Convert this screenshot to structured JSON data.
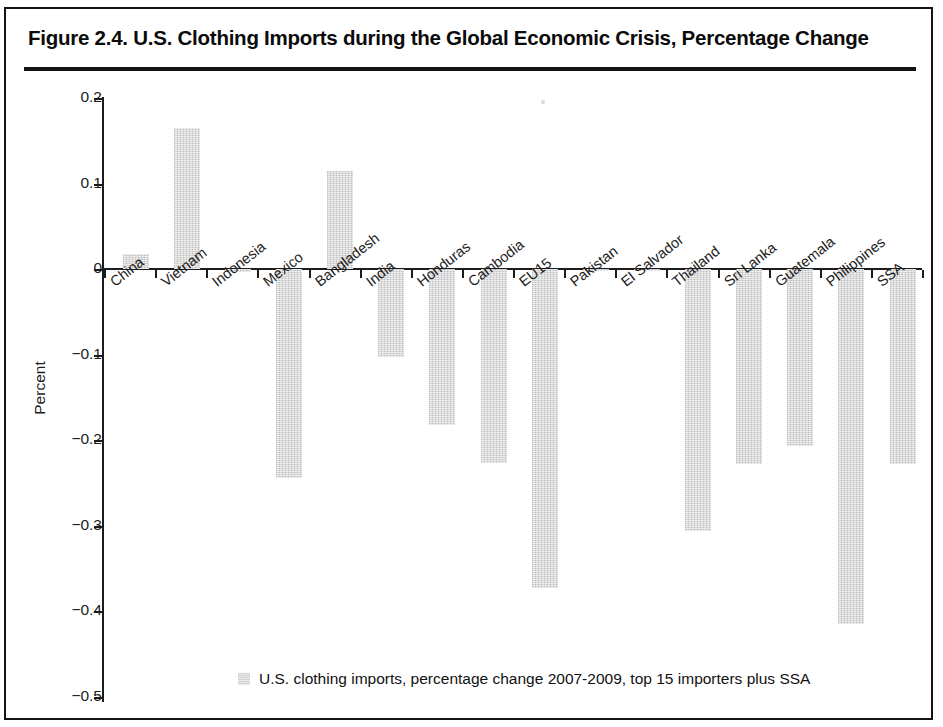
{
  "figure": {
    "title": "Figure 2.4. U.S. Clothing Imports during the Global Economic Crisis, Percentage Change"
  },
  "legend": {
    "label": "U.S. clothing imports, percentage change 2007-2009, top 15 importers plus SSA",
    "swatch_color": "#d3d3d3",
    "position": "bottom-center"
  },
  "axis": {
    "y_title": "Percent",
    "y_ticks": [
      "0.2",
      "0.1",
      "0",
      "−0.1",
      "−0.2",
      "−0.3",
      "−0.4",
      "−0.5"
    ]
  },
  "chart_data": {
    "type": "bar",
    "title": "Figure 2.4. U.S. Clothing Imports during the Global Economic Crisis, Percentage Change",
    "xlabel": "",
    "ylabel": "Percent",
    "ylim": [
      -0.5,
      0.2
    ],
    "ytick_values": [
      0.2,
      0.1,
      0,
      -0.1,
      -0.2,
      -0.3,
      -0.4,
      -0.5
    ],
    "grid": false,
    "bar_color": "#d8d8d8",
    "categories": [
      "China",
      "Vietnam",
      "Indonesia",
      "Mexico",
      "Bangladesh",
      "India",
      "Honduras",
      "Cambodia",
      "EU15",
      "Pakistan",
      "El Salvador",
      "Thailand",
      "Sri Lanka",
      "Guatemala",
      "Philippines",
      "SSA"
    ],
    "series": [
      {
        "name": "U.S. clothing imports, percentage change 2007-2009, top 15 importers plus SSA",
        "values": [
          0.017,
          0.165,
          -0.003,
          -0.245,
          0.115,
          -0.103,
          -0.183,
          -0.227,
          -0.373,
          -0.002,
          -0.002,
          -0.307,
          -0.228,
          -0.207,
          -0.415,
          -0.228
        ]
      }
    ]
  }
}
